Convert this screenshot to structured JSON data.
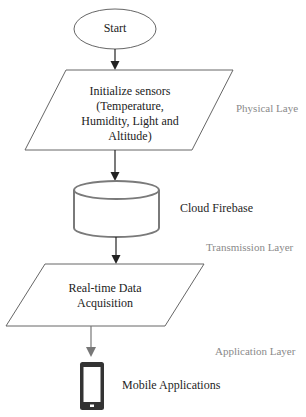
{
  "diagram": {
    "type": "flowchart",
    "nodes": [
      {
        "id": "start",
        "shape": "ellipse",
        "label": "Start"
      },
      {
        "id": "init",
        "shape": "parallelogram",
        "lines": [
          "Initialize sensors",
          "(Temperature,",
          "Humidity, Light and",
          "Altitude)"
        ]
      },
      {
        "id": "cloud",
        "shape": "cylinder",
        "label": "Cloud Firebase"
      },
      {
        "id": "acq",
        "shape": "parallelogram",
        "lines": [
          "Real-time Data",
          "Acquisition"
        ]
      },
      {
        "id": "mobile",
        "shape": "mobile-device-icon",
        "label": "Mobile Applications"
      }
    ],
    "edges": [
      {
        "from": "start",
        "to": "init"
      },
      {
        "from": "init",
        "to": "cloud"
      },
      {
        "from": "cloud",
        "to": "acq"
      },
      {
        "from": "acq",
        "to": "mobile"
      }
    ],
    "layers": {
      "physical": "Physical Laye",
      "transmission": "Transmission Layer",
      "application": "Application Layer"
    },
    "colors": {
      "stroke": "#555555",
      "arrow": "#222222",
      "arrow_last": "#777777",
      "cylinder_stroke": "#7a7a7a",
      "layer_text": "#8a8a8a",
      "device": "#333333"
    }
  }
}
